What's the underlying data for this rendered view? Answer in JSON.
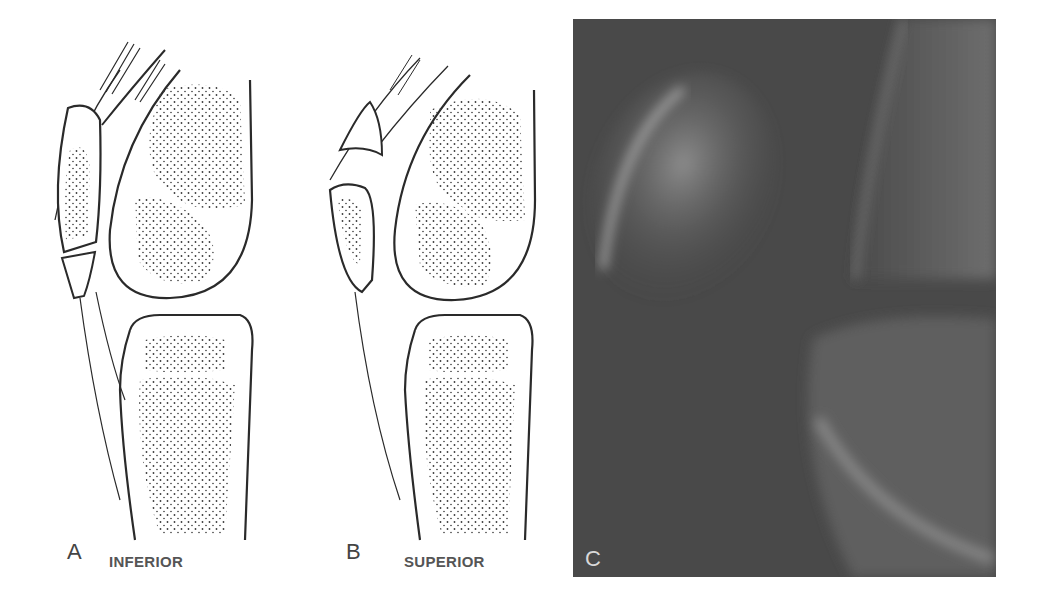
{
  "figure": {
    "panels": [
      {
        "id": "A",
        "letter": "A",
        "caption": "INFERIOR",
        "type": "line-illustration",
        "subject": "sagittal knee drawing, patellar sleeve avulsion at inferior pole"
      },
      {
        "id": "B",
        "letter": "B",
        "caption": "SUPERIOR",
        "type": "line-illustration",
        "subject": "sagittal knee drawing, patellar sleeve avulsion at superior pole"
      },
      {
        "id": "C",
        "letter": "C",
        "caption": "",
        "type": "radiograph",
        "subject": "lateral knee radiograph"
      }
    ],
    "colors": {
      "background": "#ffffff",
      "line": "#2a2a2a",
      "stipple": "#3a3a3a",
      "label": "#555555",
      "xray_base": "#4a4a4a",
      "xray_bone": "#9a9a9a",
      "xray_letter": "#d8d8d8"
    }
  }
}
